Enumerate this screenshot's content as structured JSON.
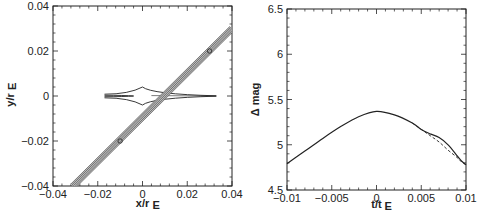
{
  "chart_data": [
    {
      "type": "line",
      "panel": "left",
      "title": "",
      "xlabel": "x/r_E",
      "ylabel": "y/r_E",
      "xlim": [
        -0.04,
        0.04
      ],
      "ylim": [
        -0.04,
        0.04
      ],
      "xticks": [
        "-0.04",
        "-0.02",
        "0",
        "0.02",
        "0.04"
      ],
      "yticks": [
        "0.04",
        "0.02",
        "0",
        "-0.02",
        "-0.04"
      ],
      "grid": false,
      "series": [
        {
          "name": "caustic",
          "style": "solid",
          "description": "Cusp-shaped caustic: central astroid-like diamond with cusps at (0, 0.004) and (0, -0.004), elongated cusps to the left (x≈-0.017) and right (x≈0.033) along y≈0",
          "x": [
            -0.017,
            -0.004,
            0,
            0.004,
            0.033,
            0.004,
            0,
            -0.004,
            -0.017
          ],
          "y": [
            0.0007,
            0.0015,
            0.004,
            0.0015,
            0,
            -0.0015,
            -0.004,
            -0.0015,
            -0.0007
          ]
        },
        {
          "name": "source-track",
          "style": "multiple parallel lines (source size band)",
          "description": "Diagonal source trajectory crossing caustic near (0.01, 0), with circular markers at intervals",
          "x": [
            -0.031,
            0.04
          ],
          "y": [
            -0.04,
            0.03
          ],
          "markers_x": [
            -0.01,
            0.03
          ],
          "markers_y": [
            -0.02,
            0.02
          ]
        }
      ]
    },
    {
      "type": "line",
      "panel": "right",
      "title": "",
      "xlabel": "t/t_E",
      "ylabel": "Δ mag",
      "xlim": [
        -0.01,
        0.01
      ],
      "ylim": [
        4.5,
        6.5
      ],
      "xticks": [
        "-0.01",
        "-0.005",
        "0",
        "0.005",
        "0.01"
      ],
      "yticks": [
        "6.5",
        "6",
        "5.5",
        "5",
        "4.5"
      ],
      "grid": false,
      "series": [
        {
          "name": "solid",
          "style": "solid",
          "x": [
            -0.01,
            -0.008,
            -0.006,
            -0.004,
            -0.002,
            0,
            0.002,
            0.004,
            0.005,
            0.006,
            0.007,
            0.008,
            0.009,
            0.0095,
            0.01
          ],
          "y": [
            4.79,
            4.93,
            5.07,
            5.2,
            5.31,
            5.37,
            5.33,
            5.24,
            5.17,
            5.12,
            5.08,
            5.0,
            4.88,
            4.82,
            4.78
          ]
        },
        {
          "name": "dashed",
          "style": "dashed",
          "x": [
            0.004,
            0.005,
            0.006,
            0.007,
            0.008,
            0.009,
            0.0095,
            0.01
          ],
          "y": [
            5.24,
            5.17,
            5.1,
            5.03,
            4.94,
            4.86,
            4.81,
            4.78
          ]
        }
      ]
    }
  ]
}
